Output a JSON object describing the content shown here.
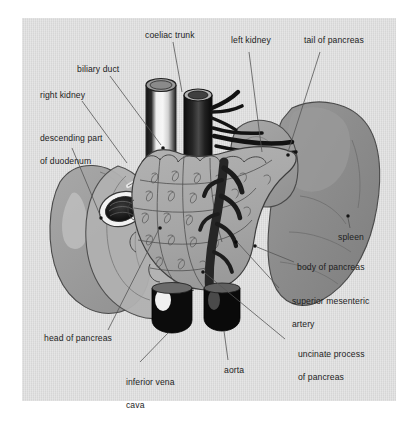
{
  "figure": {
    "plate_background": "#d6d6d6",
    "page_background": "#ffffff"
  },
  "palette": {
    "pancreas": "#a9a9a9",
    "spleen": "#8e8e8e",
    "kidney": "#9d9d9d",
    "duodenum": "#acacac",
    "vessel_dark": "#111111",
    "vessel_light": "#e9e9e9",
    "outline": "#3a3a3a",
    "label_text": "#1d1d1d",
    "leader_line": "#555555"
  },
  "labels": [
    {
      "id": "coeliac-trunk",
      "text": "coeliac trunk",
      "x": 145,
      "y": 30,
      "lines": [
        "coeliac trunk"
      ]
    },
    {
      "id": "left-kidney",
      "text": "left kidney",
      "x": 231,
      "y": 41,
      "lines": [
        "left kidney"
      ]
    },
    {
      "id": "tail-of-pancreas",
      "text": "tail of pancreas",
      "x": 304,
      "y": 41,
      "lines": [
        "tail of pancreas"
      ]
    },
    {
      "id": "biliary-duct",
      "text": "biliary duct",
      "x": 77,
      "y": 65,
      "lines": [
        "biliary duct"
      ]
    },
    {
      "id": "right-kidney",
      "text": "right kidney",
      "x": 40,
      "y": 91,
      "lines": [
        "right kidney"
      ]
    },
    {
      "id": "descending-part-of-duodenum",
      "text": "descending part of duodenum",
      "x": 30,
      "y": 123,
      "lines": [
        "descending part",
        "of duodenum"
      ]
    },
    {
      "id": "spleen",
      "text": "spleen",
      "x": 338,
      "y": 233,
      "lines": [
        "spleen"
      ]
    },
    {
      "id": "body-of-pancreas",
      "text": "body of pancreas",
      "x": 297,
      "y": 263,
      "lines": [
        "body of pancreas"
      ]
    },
    {
      "id": "superior-mesenteric-artery",
      "text": "superior mesenteric artery",
      "x": 282,
      "y": 286,
      "lines": [
        "superior mesenteric",
        "artery"
      ]
    },
    {
      "id": "uncinate-process-of-pancreas",
      "text": "uncinate process of pancreas",
      "x": 288,
      "y": 339,
      "lines": [
        "uncinate process",
        "of pancreas"
      ]
    },
    {
      "id": "head-of-pancreas",
      "text": "head of pancreas",
      "x": 44,
      "y": 334,
      "lines": [
        "head of pancreas"
      ]
    },
    {
      "id": "inferior-vena-cava",
      "text": "inferior vena cava",
      "x": 116,
      "y": 367,
      "lines": [
        "inferior vena",
        "cava"
      ]
    },
    {
      "id": "aorta",
      "text": "aorta",
      "x": 224,
      "y": 366,
      "lines": [
        "aorta"
      ]
    }
  ],
  "leaders": [
    {
      "id": "leader-coeliac-trunk",
      "points": "173,42 180,88"
    },
    {
      "id": "leader-left-kidney",
      "points": "249,52 262,130"
    },
    {
      "id": "leader-tail-of-pancreas",
      "points": "320,52 288,155"
    },
    {
      "id": "leader-biliary-duct",
      "points": "110,76 163,148"
    },
    {
      "id": "leader-right-kidney",
      "points": "82,101 128,164"
    },
    {
      "id": "leader-descending-duodenum",
      "points": "72,147 120,200"
    },
    {
      "id": "leader-spleen",
      "points": "350,230 348,216"
    },
    {
      "id": "leader-body-of-pancreas",
      "points": "295,266 253,247"
    },
    {
      "id": "leader-sma",
      "points": "280,290 235,243"
    },
    {
      "id": "leader-uncinate",
      "points": "286,341 205,274"
    },
    {
      "id": "leader-head-of-pancreas",
      "points": "108,331 161,226"
    },
    {
      "id": "leader-ivc",
      "points": "140,364 192,307"
    },
    {
      "id": "leader-aorta",
      "points": "228,362 215,318"
    }
  ],
  "structures": [
    {
      "id": "spleen",
      "name": "spleen",
      "tone": "#8e8e8e"
    },
    {
      "id": "left-kidney",
      "name": "left kidney",
      "tone": "#9d9d9d"
    },
    {
      "id": "right-kidney",
      "name": "right kidney",
      "tone": "#9d9d9d"
    },
    {
      "id": "duodenum",
      "name": "descending duodenum",
      "tone": "#acacac"
    },
    {
      "id": "pancreas",
      "name": "pancreas",
      "tone": "#a9a9a9"
    },
    {
      "id": "ivc",
      "name": "inferior vena cava",
      "tone": "#e9e9e9"
    },
    {
      "id": "aorta",
      "name": "aorta",
      "tone": "#111111"
    },
    {
      "id": "coeliac-trunk",
      "name": "coeliac trunk",
      "tone": "#111111"
    },
    {
      "id": "sma",
      "name": "superior mesenteric artery",
      "tone": "#2a2a2a"
    },
    {
      "id": "biliary-duct",
      "name": "biliary duct",
      "tone": "#d8d8d8"
    }
  ]
}
